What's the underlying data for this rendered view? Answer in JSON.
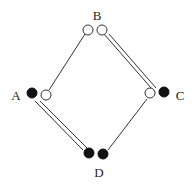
{
  "diagram": {
    "type": "lattice",
    "colors": {
      "line": "#333333",
      "filled": "#111111",
      "hollow_fill": "#ffffff",
      "background": "#ffffff"
    },
    "nodes": [
      {
        "id": "B",
        "label": "B",
        "label_pos": [
          97,
          20
        ],
        "circles": [
          {
            "x": 88,
            "y": 30,
            "r": 5,
            "style": "hollow"
          },
          {
            "x": 102,
            "y": 30,
            "r": 5,
            "style": "hollow"
          }
        ]
      },
      {
        "id": "A",
        "label": "A",
        "label_pos": [
          16,
          100
        ],
        "circles": [
          {
            "x": 32,
            "y": 93,
            "r": 5,
            "style": "filled"
          },
          {
            "x": 46,
            "y": 95,
            "r": 5,
            "style": "hollow"
          }
        ]
      },
      {
        "id": "C",
        "label": "C",
        "label_pos": [
          180,
          100
        ],
        "circles": [
          {
            "x": 150,
            "y": 93,
            "r": 5,
            "style": "hollow"
          },
          {
            "x": 164,
            "y": 92,
            "r": 5,
            "style": "filled"
          }
        ]
      },
      {
        "id": "D",
        "label": "D",
        "label_pos": [
          99,
          177
        ],
        "circles": [
          {
            "x": 89,
            "y": 153,
            "r": 5,
            "style": "filled"
          },
          {
            "x": 103,
            "y": 154,
            "r": 5,
            "style": "filled"
          }
        ]
      }
    ],
    "edges": [
      {
        "from": "B",
        "to": "A",
        "kind": "single"
      },
      {
        "from": "B",
        "to": "C",
        "kind": "double"
      },
      {
        "from": "A",
        "to": "D",
        "kind": "double"
      },
      {
        "from": "C",
        "to": "D",
        "kind": "single"
      }
    ]
  }
}
